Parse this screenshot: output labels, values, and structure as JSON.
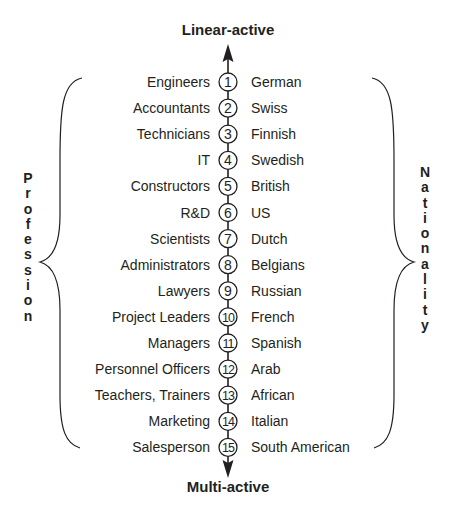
{
  "diagram": {
    "top_label": "Linear-active",
    "bottom_label": "Multi-active",
    "left_axis_label": "Profession",
    "right_axis_label": "Nationality",
    "rows": [
      {
        "rank": "1",
        "profession": "Engineers",
        "nationality": "German"
      },
      {
        "rank": "2",
        "profession": "Accountants",
        "nationality": "Swiss"
      },
      {
        "rank": "3",
        "profession": "Technicians",
        "nationality": "Finnish"
      },
      {
        "rank": "4",
        "profession": "IT",
        "nationality": "Swedish"
      },
      {
        "rank": "5",
        "profession": "Constructors",
        "nationality": "British"
      },
      {
        "rank": "6",
        "profession": "R&D",
        "nationality": "US"
      },
      {
        "rank": "7",
        "profession": "Scientists",
        "nationality": "Dutch"
      },
      {
        "rank": "8",
        "profession": "Administrators",
        "nationality": "Belgians"
      },
      {
        "rank": "9",
        "profession": "Lawyers",
        "nationality": "Russian"
      },
      {
        "rank": "10",
        "profession": "Project Leaders",
        "nationality": "French"
      },
      {
        "rank": "11",
        "profession": "Managers",
        "nationality": "Spanish"
      },
      {
        "rank": "12",
        "profession": "Personnel Officers",
        "nationality": "Arab"
      },
      {
        "rank": "13",
        "profession": "Teachers, Trainers",
        "nationality": "African"
      },
      {
        "rank": "14",
        "profession": "Marketing",
        "nationality": "Italian"
      },
      {
        "rank": "15",
        "profession": "Salesperson",
        "nationality": "South American"
      }
    ]
  },
  "colors": {
    "ink": "#231f20",
    "background": "#ffffff"
  }
}
